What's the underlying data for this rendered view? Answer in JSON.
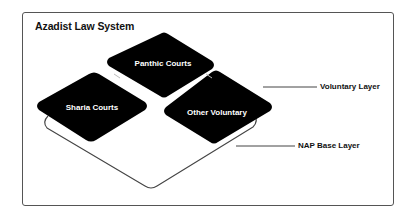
{
  "diagram": {
    "title": "Azadist Law System",
    "tiles": [
      {
        "id": "panthic",
        "label": "Panthic Courts"
      },
      {
        "id": "sharia",
        "label": "Sharia Courts"
      },
      {
        "id": "other",
        "label": "Other Voluntary"
      }
    ],
    "layers": [
      {
        "id": "voluntary",
        "label": "Voluntary Layer"
      },
      {
        "id": "nap",
        "label": "NAP Base Layer"
      }
    ],
    "colors": {
      "tile_fill": "#000000",
      "tile_text": "#ffffff",
      "outline": "#444444",
      "background": "#ffffff"
    }
  }
}
